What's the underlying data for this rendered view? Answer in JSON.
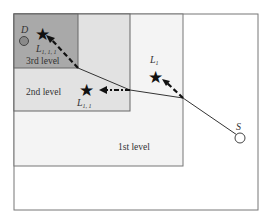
{
  "diagram": {
    "levels": [
      {
        "label": "1st level",
        "fill": "#f4f4f4"
      },
      {
        "label": "2nd level",
        "fill": "#e4e4e4"
      },
      {
        "label": "3rd level",
        "fill": "#a8a8a8"
      }
    ],
    "nodes": {
      "source": "S",
      "destination": "D",
      "landmark1": "L",
      "landmark1_sub": "1",
      "landmark2": "L",
      "landmark2_sub": "1, 1",
      "landmark3": "L",
      "landmark3_sub": "1, 1, 1"
    }
  }
}
